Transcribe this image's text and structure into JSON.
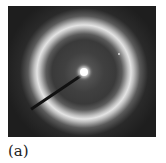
{
  "figure": {
    "panel_label": "(a)",
    "colors": {
      "background": "#1e1e1e",
      "ring": "#e4e4e4",
      "center_spot": "#ffffff"
    }
  }
}
